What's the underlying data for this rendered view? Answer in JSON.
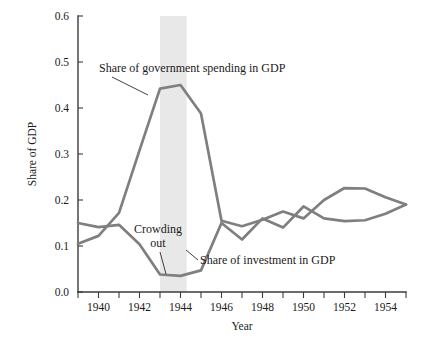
{
  "chart_data": {
    "type": "line",
    "title": "",
    "xlabel": "Year",
    "ylabel": "Share of GDP",
    "xlim": [
      1939,
      1955
    ],
    "ylim": [
      0.0,
      0.6
    ],
    "grid": false,
    "legend_position": "inline-annotations",
    "x": [
      1939,
      1940,
      1941,
      1942,
      1943,
      1944,
      1945,
      1946,
      1947,
      1948,
      1949,
      1950,
      1951,
      1952,
      1953,
      1954,
      1955
    ],
    "xtick_labels": [
      "1940",
      "1942",
      "1944",
      "1946",
      "1948",
      "1950",
      "1952",
      "1954"
    ],
    "xtick_values": [
      1940,
      1942,
      1944,
      1946,
      1948,
      1950,
      1952,
      1954
    ],
    "xtick_minor_values": [
      1939,
      1941,
      1943,
      1945,
      1947,
      1949,
      1951,
      1953,
      1955
    ],
    "ytick_labels": [
      "0.0",
      "0.1",
      "0.2",
      "0.3",
      "0.4",
      "0.5",
      "0.6"
    ],
    "ytick_values": [
      0.0,
      0.1,
      0.2,
      0.3,
      0.4,
      0.5,
      0.6
    ],
    "series": [
      {
        "name": "Share of government spending in GDP",
        "color": "#7f7f7f",
        "values": [
          0.105,
          0.122,
          0.172,
          0.308,
          0.442,
          0.45,
          0.388,
          0.155,
          0.143,
          0.157,
          0.175,
          0.16,
          0.2,
          0.226,
          0.225,
          0.206,
          0.19
        ]
      },
      {
        "name": "Share of investment in GDP",
        "color": "#7f7f7f",
        "values": [
          0.15,
          0.141,
          0.146,
          0.104,
          0.038,
          0.035,
          0.047,
          0.15,
          0.114,
          0.16,
          0.14,
          0.186,
          0.16,
          0.154,
          0.156,
          0.17,
          0.19
        ]
      }
    ],
    "shaded_bands": [
      {
        "label": "Crowding out",
        "x_start": 1943,
        "x_end": 1944.3,
        "color": "#e8e8e8"
      }
    ],
    "annotations": [
      {
        "name": "government-spending-label",
        "text": "Share of government spending in GDP"
      },
      {
        "name": "investment-label",
        "text": "Share of investment in GDP"
      },
      {
        "name": "crowding-out-label-line1",
        "text": "Crowding"
      },
      {
        "name": "crowding-out-label-line2",
        "text": "out"
      }
    ]
  }
}
